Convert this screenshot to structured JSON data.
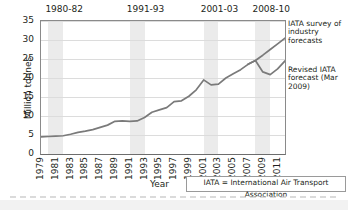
{
  "chart_data": {
    "type": "line",
    "title": "",
    "xlabel": "Year",
    "ylabel": "Million tonnes",
    "ylim": [
      0,
      35
    ],
    "ytick_values": [
      0,
      5,
      10,
      15,
      20,
      25,
      30,
      35
    ],
    "xlim": [
      1979,
      2012
    ],
    "xtick_labels": [
      "1979",
      "1981",
      "1983",
      "1985",
      "1987",
      "1989",
      "1991",
      "1993",
      "1995",
      "1997",
      "1999",
      "2001",
      "2003",
      "2005",
      "2007",
      "2009",
      "2011"
    ],
    "grid": true,
    "legend_position": "right-outside",
    "shaded_bands": [
      {
        "label": "1980-82",
        "start": 1980,
        "end": 1982
      },
      {
        "label": "1991-93",
        "start": 1991,
        "end": 1993
      },
      {
        "label": "2001-03",
        "start": 2001,
        "end": 2003
      },
      {
        "label": "2008-10",
        "start": 2008,
        "end": 2010
      }
    ],
    "series": [
      {
        "name": "IATA survey of industry forecasts",
        "x": [
          1979,
          1980,
          1981,
          1982,
          1983,
          1984,
          1985,
          1986,
          1987,
          1988,
          1989,
          1990,
          1991,
          1992,
          1993,
          1994,
          1995,
          1996,
          1997,
          1998,
          1999,
          2000,
          2001,
          2002,
          2003,
          2004,
          2005,
          2006,
          2007,
          2008,
          2009,
          2010,
          2011,
          2012
        ],
        "values": [
          4.5,
          4.6,
          4.7,
          4.8,
          5.2,
          5.7,
          6.0,
          6.4,
          7.0,
          7.6,
          8.6,
          8.7,
          8.6,
          8.7,
          9.6,
          11.0,
          11.6,
          12.2,
          13.8,
          14.0,
          15.2,
          16.9,
          19.5,
          18.2,
          18.4,
          20.0,
          21.1,
          22.2,
          23.6,
          24.6,
          26.0,
          27.5,
          29.0,
          30.5
        ]
      },
      {
        "name": "Revised IATA forecast (Mar 2009)",
        "x": [
          2007,
          2008,
          2009,
          2010,
          2011,
          2012
        ],
        "values": [
          23.6,
          24.6,
          21.6,
          20.9,
          22.4,
          24.5
        ]
      }
    ],
    "annotations": [
      {
        "name": "survey-forecast-label",
        "text": "IATA survey of industry forecasts"
      },
      {
        "name": "revised-forecast-label",
        "text": "Revised IATA forecast (Mar 2009)"
      }
    ],
    "footnote": "IATA = International Air Transport Association",
    "colors": {
      "line": "#7a7a7a",
      "band": "#ebebeb",
      "grid": "#dcdcdc",
      "axis": "#8a8a8a",
      "text": "#231f20",
      "background": "#ffffff"
    }
  }
}
